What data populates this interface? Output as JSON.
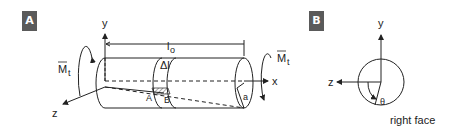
{
  "panel_a": {
    "badge": "A",
    "labels": {
      "y_axis": "y",
      "x_axis": "x",
      "z_axis": "z",
      "length": "l",
      "length_sub": "o",
      "delta": "Δl",
      "torque_left": "M",
      "torque_left_sub": "t",
      "torque_right": "M",
      "torque_right_sub": "t",
      "point_a": "A",
      "point_b": "B",
      "radius": "a"
    }
  },
  "panel_b": {
    "badge": "B",
    "labels": {
      "y_axis": "y",
      "z_axis": "z",
      "angle": "θ",
      "caption": "right face"
    }
  },
  "colors": {
    "badge_bg": "#5a5a5a",
    "ink": "#222222"
  }
}
